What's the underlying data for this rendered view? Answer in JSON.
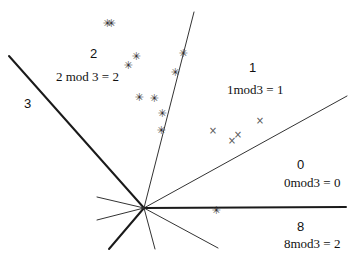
{
  "diagram": {
    "title": "",
    "origin": {
      "x": 144,
      "y": 208
    },
    "rays": [
      {
        "id": "ray-upper-left",
        "x2": 9,
        "y2": 56,
        "weight": "thick"
      },
      {
        "id": "ray-up",
        "x2": 194,
        "y2": 12,
        "weight": "thin"
      },
      {
        "id": "ray-upper-right",
        "x2": 347,
        "y2": 96,
        "weight": "thin"
      },
      {
        "id": "ray-right",
        "x2": 346,
        "y2": 207,
        "weight": "thick"
      },
      {
        "id": "ray-lower-right",
        "x2": 218,
        "y2": 248,
        "weight": "thin"
      },
      {
        "id": "ray-down",
        "x2": 155,
        "y2": 249,
        "weight": "thin"
      },
      {
        "id": "ray-lower-left",
        "x2": 109,
        "y2": 249,
        "weight": "thick"
      },
      {
        "id": "ray-left-up",
        "x2": 97,
        "y2": 197,
        "weight": "thin"
      },
      {
        "id": "ray-left-down",
        "x2": 97,
        "y2": 220,
        "weight": "thin"
      }
    ],
    "regions": [
      {
        "label": "3",
        "equation": "",
        "label_x": 24,
        "label_y": 104
      },
      {
        "label": "2",
        "equation": "2 mod 3 = 2",
        "label_x": 90,
        "label_y": 54,
        "eq_x": 56,
        "eq_y": 77
      },
      {
        "label": "1",
        "equation": "1mod3 = 1",
        "label_x": 249,
        "label_y": 68,
        "eq_x": 227,
        "eq_y": 90
      },
      {
        "label": "0",
        "equation": "0mod3 = 0",
        "label_x": 297,
        "label_y": 165,
        "eq_x": 284,
        "eq_y": 183
      },
      {
        "label": "8",
        "equation": "8mod3 = 2",
        "label_x": 297,
        "label_y": 227,
        "eq_x": 284,
        "eq_y": 244
      }
    ],
    "star_points": [
      {
        "x": 107,
        "y": 23
      },
      {
        "x": 111,
        "y": 23
      },
      {
        "x": 136,
        "y": 56
      },
      {
        "x": 128,
        "y": 65
      },
      {
        "x": 183,
        "y": 53
      },
      {
        "x": 175,
        "y": 72
      },
      {
        "x": 139,
        "y": 97
      },
      {
        "x": 154,
        "y": 98
      },
      {
        "x": 162,
        "y": 113
      },
      {
        "x": 161,
        "y": 130
      },
      {
        "x": 216,
        "y": 210
      }
    ],
    "x_points": [
      {
        "x": 213,
        "y": 131
      },
      {
        "x": 232,
        "y": 141
      },
      {
        "x": 238,
        "y": 135
      },
      {
        "x": 260,
        "y": 121
      }
    ],
    "colors": {
      "line": "#1a1a1a",
      "thin_line": "#333333",
      "star": "#333333",
      "cross": "#555555"
    }
  }
}
